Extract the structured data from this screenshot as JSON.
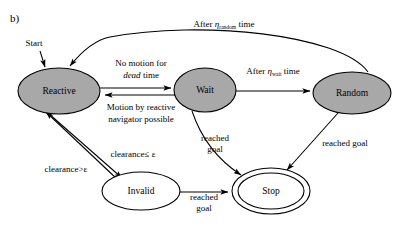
{
  "figure": {
    "panel_label": "b)",
    "type": "state-machine-diagram",
    "start_label": "Start"
  },
  "colors": {
    "node_fill_active": "#a8a8a8",
    "node_fill_inactive": "#ffffff",
    "stroke": "#000000",
    "background": "#ffffff"
  },
  "nodes": [
    {
      "id": "reactive",
      "label": "Reactive",
      "style": "filled-gray",
      "cx": 59,
      "cy": 91,
      "rx": 41,
      "ry": 23
    },
    {
      "id": "wait",
      "label": "Wait",
      "style": "filled-gray",
      "cx": 205,
      "cy": 90,
      "rx": 31,
      "ry": 22
    },
    {
      "id": "random",
      "label": "Random",
      "style": "filled-gray",
      "cx": 352,
      "cy": 93,
      "rx": 39,
      "ry": 21
    },
    {
      "id": "invalid",
      "label": "Invalid",
      "style": "outline-white",
      "cx": 141,
      "cy": 191,
      "rx": 39,
      "ry": 19
    },
    {
      "id": "stop",
      "label": "Stop",
      "style": "double-outline",
      "cx": 271,
      "cy": 191,
      "rx": 39,
      "ry": 23
    }
  ],
  "edges": [
    {
      "id": "start-reactive",
      "from": "(start)",
      "to": "reactive",
      "label": ""
    },
    {
      "id": "random-reactive",
      "from": "random",
      "to": "reactive",
      "label_parts": {
        "pre": "After ",
        "symbol": "η",
        "sub": "random",
        "post": " time"
      },
      "label_text": "After ηrandom time"
    },
    {
      "id": "reactive-wait",
      "from": "reactive",
      "to": "wait",
      "label_line1": "No motion for",
      "label_line2_italic": "dead",
      "label_line2_rest": " time",
      "label_text": "No motion for dead time"
    },
    {
      "id": "wait-reactive",
      "from": "wait",
      "to": "reactive",
      "label_line1": "Motion by reactive",
      "label_line2": "navigator possible",
      "label_text": "Motion by reactive navigator possible"
    },
    {
      "id": "wait-random",
      "from": "wait",
      "to": "random",
      "label_parts": {
        "pre": "After ",
        "symbol": "η",
        "sub": "wait",
        "post": " time"
      },
      "label_text": "After ηwait time"
    },
    {
      "id": "reactive-invalid",
      "from": "reactive",
      "to": "invalid",
      "label_text": "clearance≤ ε"
    },
    {
      "id": "invalid-reactive",
      "from": "invalid",
      "to": "reactive",
      "label_text": "clearance>ε"
    },
    {
      "id": "wait-stop",
      "from": "wait",
      "to": "stop",
      "label_line1": "reached",
      "label_line2": "goal",
      "label_text": "reached goal"
    },
    {
      "id": "invalid-stop",
      "from": "invalid",
      "to": "stop",
      "label_line1": "reached",
      "label_line2": "goal",
      "label_text": "reached goal"
    },
    {
      "id": "random-stop",
      "from": "random",
      "to": "stop",
      "label_text": "reached goal"
    }
  ],
  "labels": {
    "no_motion_l1": "No motion for",
    "dead_italic": "dead",
    "dead_rest": " time",
    "motion_l1": "Motion by reactive",
    "motion_l2": "navigator possible",
    "after_pre": "After ",
    "eta": "η",
    "sub_random": "random",
    "sub_wait": "wait",
    "after_post": " time",
    "clearance_le": "clearance≤ ε",
    "clearance_gt": "clearance>ε",
    "reached": "reached",
    "goal": "goal",
    "reached_goal": "reached goal"
  }
}
